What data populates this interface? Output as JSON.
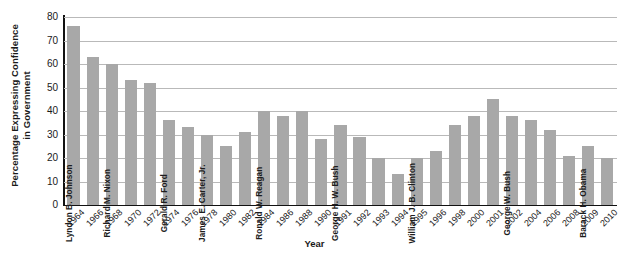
{
  "chart_data": {
    "type": "bar",
    "title": "",
    "xlabel": "Year",
    "ylabel": "Percentage Expressing Confidence in Government",
    "ylabel_line1": "Percentage Expressing Confidence",
    "ylabel_line2": "in Government",
    "ylim": [
      0,
      80
    ],
    "ytick_step": 10,
    "yticks": [
      "80",
      "70",
      "60",
      "50",
      "40",
      "30",
      "20",
      "10",
      "0"
    ],
    "grid": "horizontal",
    "legend": "none",
    "bar_color": "#a8a8a8",
    "categories": [
      "1964",
      "1966",
      "1968",
      "1970",
      "1972",
      "1974",
      "1976",
      "1978",
      "1980",
      "1982",
      "1984",
      "1986",
      "1988",
      "1990",
      "1991",
      "1992",
      "1993",
      "1994",
      "1995",
      "1996",
      "1998",
      "2000",
      "2001",
      "2002",
      "2004",
      "2006",
      "2008",
      "2009",
      "2010"
    ],
    "values": [
      76,
      63,
      60,
      53,
      52,
      36,
      33,
      30,
      25,
      31,
      40,
      38,
      40,
      28,
      34,
      29,
      20,
      13,
      20,
      23,
      34,
      38,
      45,
      38,
      36,
      32,
      21,
      25,
      20
    ],
    "annotations": [
      {
        "index": 0,
        "text": "Lyndon B. Johnson"
      },
      {
        "index": 2,
        "text": "Richard M. Nixon"
      },
      {
        "index": 5,
        "text": "Gerald R. Ford"
      },
      {
        "index": 7,
        "text": "James E. Carter, Jr."
      },
      {
        "index": 10,
        "text": "Ronald W. Reagan"
      },
      {
        "index": 14,
        "text": "George H. W. Bush"
      },
      {
        "index": 18,
        "text": "William J. B. Clinton"
      },
      {
        "index": 23,
        "text": "George W. Bush"
      },
      {
        "index": 27,
        "text": "Barack H. Obama"
      }
    ]
  }
}
